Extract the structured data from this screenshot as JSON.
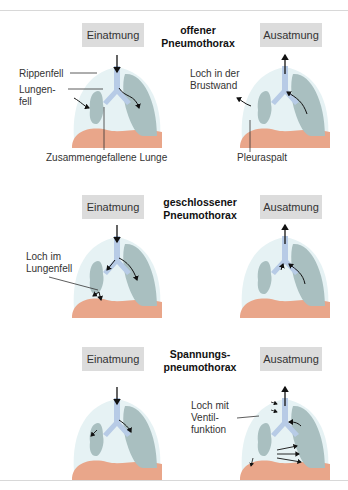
{
  "sections": [
    {
      "title_line1": "offener",
      "title_line2": "Pneumothorax",
      "left_phase": "Einatmung",
      "right_phase": "Ausatmung",
      "labels": {
        "rippenfell": "Rippenfell",
        "lungenfell_1": "Lungen-",
        "lungenfell_2": "fell",
        "collapsed_lung": "Zusammengefallene Lunge",
        "hole_chest_1": "Loch in der",
        "hole_chest_2": "Brustwand",
        "pleural_gap": "Pleuraspalt"
      }
    },
    {
      "title_line1": "geschlossener",
      "title_line2": "Pneumothorax",
      "left_phase": "Einatmung",
      "right_phase": "Ausatmung",
      "labels": {
        "hole_lung_1": "Loch im",
        "hole_lung_2": "Lungenfell"
      }
    },
    {
      "title_line1": "Spannungs-",
      "title_line2": "pneumothorax",
      "left_phase": "Einatmung",
      "right_phase": "Ausatmung",
      "labels": {
        "valve_1": "Loch mit",
        "valve_2": "Ventil-",
        "valve_3": "funktion"
      }
    }
  ],
  "colors": {
    "pleura_space": "#e6f2f4",
    "lung": "#a9bfc0",
    "trachea": "#b7cbe6",
    "diaphragm": "#e9a68a",
    "phase_box": "#dcdcdc",
    "rule": "#d8d8d8"
  }
}
